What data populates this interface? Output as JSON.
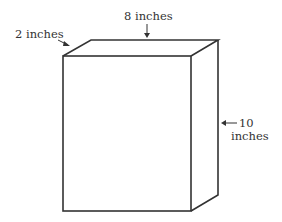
{
  "diagram": {
    "type": "rectangular-prism",
    "labels": {
      "depth": "2 inches",
      "width": "8 inches",
      "height_value": "10",
      "height_unit": "inches"
    },
    "colors": {
      "stroke": "#333333",
      "background": "#ffffff"
    }
  }
}
